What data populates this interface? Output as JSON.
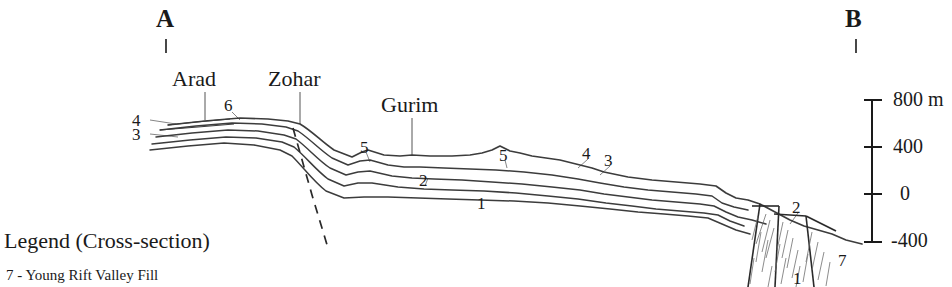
{
  "figure": {
    "type": "geological-cross-section",
    "endpoints": {
      "left": "A",
      "right": "B"
    },
    "places": [
      {
        "name": "Arad",
        "x": 205
      },
      {
        "name": "Zohar",
        "x": 305
      },
      {
        "name": "Gurim",
        "x": 415
      }
    ],
    "unit_labels": [
      {
        "id": "unit-4-left",
        "text": "4"
      },
      {
        "id": "unit-3-left",
        "text": "3"
      },
      {
        "id": "unit-6",
        "text": "6"
      },
      {
        "id": "unit-5-west",
        "text": "5"
      },
      {
        "id": "unit-5-east",
        "text": "5"
      },
      {
        "id": "unit-4-right",
        "text": "4"
      },
      {
        "id": "unit-3-right",
        "text": "3"
      },
      {
        "id": "unit-2-middle",
        "text": "2"
      },
      {
        "id": "unit-1-middle",
        "text": "1"
      },
      {
        "id": "unit-2-fault",
        "text": "2"
      },
      {
        "id": "unit-1-fault",
        "text": "1"
      },
      {
        "id": "unit-7-fault",
        "text": "7"
      }
    ],
    "scale": {
      "unit": "m",
      "ticks": [
        {
          "label": "800 m",
          "value": 800
        },
        {
          "label": "400",
          "value": 400
        },
        {
          "label": "0",
          "value": 0
        },
        {
          "label": "-400",
          "value": -400
        }
      ]
    },
    "legend": {
      "title": "Legend (Cross-section)",
      "items": [
        {
          "key": "7",
          "text": "7 - Young Rift Valley Fill"
        }
      ]
    },
    "colors": {
      "ink": "#1a1a1a",
      "line": "#3c3c3c",
      "background": "#ffffff"
    }
  }
}
